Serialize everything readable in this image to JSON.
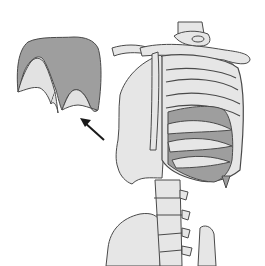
{
  "figure": {
    "panels": [
      {
        "id": "isolated-diaphragm",
        "description": "diaphragm shown isolated"
      },
      {
        "id": "skeleton-thorax",
        "description": "diaphragm shown in position within rib cage and spine"
      }
    ],
    "arrow": {
      "direction": "up-left",
      "from": "skeleton-thorax",
      "to": "isolated-diaphragm"
    },
    "colors": {
      "bone_fill": "#e6e6e6",
      "bone_stroke": "#4a4a4a",
      "diaphragm_fill": "#9e9e9e",
      "diaphragm_inner_fill": "#e2e2e2",
      "arrow": "#1a1a1a",
      "background": "#ffffff"
    }
  }
}
